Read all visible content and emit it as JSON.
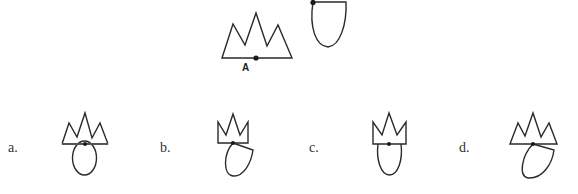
{
  "question": {
    "crown_figure": {
      "point_label": "A",
      "description": "crown-shaped polygon with three peaks; point A marked on base"
    },
    "shield_figure": {
      "description": "shield/U-shaped figure with dot at top-left corner"
    }
  },
  "options": [
    {
      "label": "a.",
      "description": "crown with oval attached below at center dot"
    },
    {
      "label": "b.",
      "description": "narrow crown with tilted shield attached at base dot"
    },
    {
      "label": "c.",
      "description": "narrow crown with oval attached below at center dot"
    },
    {
      "label": "d.",
      "description": "crown with tilted shield attached at base dot"
    }
  ],
  "colors": {
    "stroke": "#2a2a2a",
    "background": "#ffffff"
  }
}
